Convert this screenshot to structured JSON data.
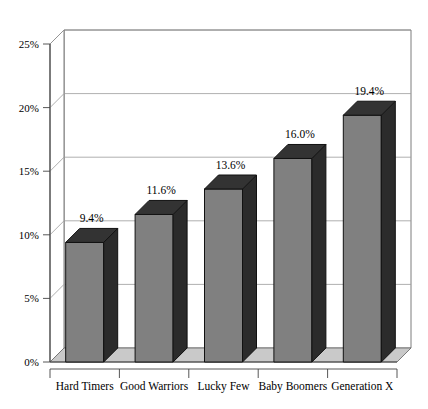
{
  "chart_data": {
    "type": "bar",
    "title": "",
    "subtitle": "",
    "xlabel": "",
    "ylabel": "",
    "categories": [
      "Hard Timers",
      "Good Warriors",
      "Lucky Few",
      "Baby Boomers",
      "Generation X"
    ],
    "values": [
      9.4,
      11.6,
      13.6,
      16.0,
      19.4
    ],
    "data_labels": [
      "9.4%",
      "11.6%",
      "13.6%",
      "16.0%",
      "19.4%"
    ],
    "ylim": [
      0,
      25
    ],
    "ytick_values": [
      0,
      5,
      10,
      15,
      20,
      25
    ],
    "ytick_labels": [
      "0%",
      "5%",
      "10%",
      "15%",
      "20%",
      "25%"
    ],
    "grid": true,
    "grid_axis": "y",
    "legend": null,
    "legend_position": "none",
    "style": "3d-column",
    "series": [
      {
        "name": "",
        "values": [
          9.4,
          11.6,
          13.6,
          16.0,
          19.4
        ]
      }
    ],
    "colors": {
      "bar_front": "#808080",
      "bar_side": "#2b2b2b",
      "bar_top": "#333333",
      "floor": "#c9c9c9",
      "wall": "#ffffff",
      "grid": "#9a9a9a",
      "axis": "#555555",
      "text": "#000000"
    }
  }
}
